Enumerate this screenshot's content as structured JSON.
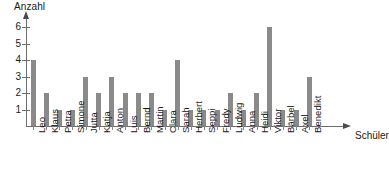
{
  "chart_data": {
    "type": "bar",
    "title": "",
    "subtitle": "",
    "xlabel": "Schüler",
    "ylabel": "Anzahl",
    "categories": [
      "Leo",
      "Klaus",
      "Petra",
      "Simone",
      "Jutta",
      "Katja",
      "Anton",
      "Luis",
      "Bernd",
      "Martin",
      "Clara",
      "Sarah",
      "Herbert",
      "Seppi",
      "Fredy",
      "Ludwig",
      "Anna",
      "Heidi",
      "Viktor",
      "Bärbel",
      "Axel",
      "Benedikt"
    ],
    "values": [
      4,
      2,
      1,
      1,
      3,
      2,
      3,
      2,
      2,
      2,
      1,
      4,
      1,
      1,
      1,
      2,
      1,
      2,
      6,
      1,
      1,
      3
    ],
    "ylim": [
      0,
      6.4
    ],
    "yticks": [
      1,
      2,
      3,
      4,
      5,
      6
    ],
    "ytick_labels": [
      "1",
      "2",
      "3",
      "4",
      "5",
      "6"
    ],
    "grid": false,
    "legend": false,
    "legend_position": "none",
    "bar_color": "#8a8a8a",
    "axis_color": "#6f6f6f"
  }
}
